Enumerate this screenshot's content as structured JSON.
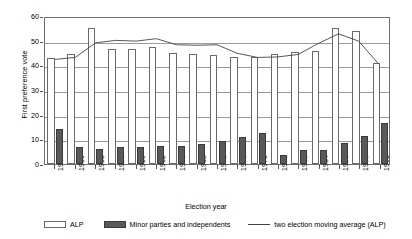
{
  "chart_data": {
    "type": "bar",
    "title": "",
    "xlabel": "Election year",
    "ylabel": "First preference vote",
    "ylim": [
      0,
      60
    ],
    "ytick_values": [
      0,
      10,
      20,
      30,
      40,
      50,
      60
    ],
    "ytick_labels": [
      "0",
      "10",
      "20",
      "30",
      "40",
      "50",
      "60"
    ],
    "grid": true,
    "legend_position": "bottom",
    "categories": [
      "1947",
      "1950",
      "1953",
      "1956",
      "1959",
      "1962",
      "1965",
      "1968",
      "1971",
      "1973",
      "1976",
      "1978",
      "1981",
      "1984",
      "1988",
      "1991",
      "1995"
    ],
    "series": [
      {
        "name": "ALP",
        "type": "bar",
        "color": "#ffffff",
        "edge_color": "#6a6a6a",
        "values": [
          43.0,
          44.5,
          55.0,
          46.5,
          46.5,
          47.5,
          45.0,
          44.5,
          44.0,
          43.5,
          43.5,
          44.5,
          45.5,
          46.0,
          55.0,
          54.0,
          41.0
        ]
      },
      {
        "name": "Minor parties and independents",
        "type": "bar",
        "color": "#595959",
        "edge_color": "#3a3a3a",
        "values": [
          14.0,
          7.0,
          6.0,
          7.0,
          7.0,
          7.2,
          7.3,
          8.0,
          9.5,
          11.0,
          12.5,
          3.5,
          5.5,
          5.5,
          8.5,
          11.5,
          16.5
        ]
      },
      {
        "name": "two election moving average (ALP)",
        "type": "line",
        "color": "#444444",
        "values": [
          43.0,
          43.8,
          49.8,
          50.8,
          50.5,
          51.5,
          49.0,
          48.8,
          49.0,
          45.5,
          43.8,
          44.0,
          45.0,
          49.5,
          53.5,
          50.5,
          41.0
        ]
      }
    ]
  },
  "axis": {
    "y_title": "First preference vote",
    "x_title": "Election year"
  },
  "legend": {
    "items": [
      {
        "label": "ALP",
        "swatch": "alp-white-swatch"
      },
      {
        "label": "Minor parties and independents",
        "swatch": "minor-dark-swatch"
      },
      {
        "label": "two election moving average (ALP)",
        "swatch": "moving-average-line-swatch"
      }
    ]
  },
  "colors": {
    "alp_fill": "#ffffff",
    "minor_fill": "#595959",
    "line": "#444444",
    "grid": "#9a9a9a",
    "frame": "#6f6f6f"
  }
}
